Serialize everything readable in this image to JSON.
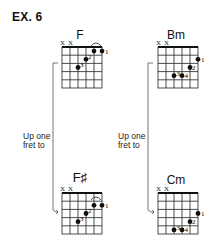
{
  "example_label": "EX. 6",
  "transitions": [
    {
      "line1": "Up one",
      "line2": "fret to"
    },
    {
      "line1": "Up one",
      "line2": "fret to"
    }
  ],
  "chords": [
    {
      "name": "F",
      "muted": [
        "X",
        "X"
      ],
      "barre": true,
      "dots": [
        {
          "string": 5,
          "fret": 1,
          "finger": "1"
        },
        {
          "string": 6,
          "fret": 1,
          "finger": ""
        },
        {
          "string": 4,
          "fret": 2,
          "finger": "2"
        },
        {
          "string": 3,
          "fret": 3,
          "finger": "3"
        }
      ]
    },
    {
      "name": "Bm",
      "muted": [
        "X",
        "X"
      ],
      "barre": false,
      "dots": [
        {
          "string": 6,
          "fret": 2,
          "finger": "1"
        },
        {
          "string": 5,
          "fret": 3,
          "finger": "2"
        },
        {
          "string": 3,
          "fret": 4,
          "finger": "3"
        },
        {
          "string": 4,
          "fret": 4,
          "finger": "4"
        }
      ]
    },
    {
      "name": "F♯",
      "muted": [
        "X",
        "X"
      ],
      "barre": true,
      "dots": [
        {
          "string": 5,
          "fret": 2,
          "finger": "1"
        },
        {
          "string": 6,
          "fret": 2,
          "finger": ""
        },
        {
          "string": 4,
          "fret": 3,
          "finger": "2"
        },
        {
          "string": 3,
          "fret": 4,
          "finger": "3"
        }
      ]
    },
    {
      "name": "Cm",
      "muted": [
        "X",
        "X"
      ],
      "barre": false,
      "dots": [
        {
          "string": 6,
          "fret": 3,
          "finger": "1"
        },
        {
          "string": 5,
          "fret": 4,
          "finger": "2"
        },
        {
          "string": 3,
          "fret": 5,
          "finger": "3"
        },
        {
          "string": 4,
          "fret": 5,
          "finger": "4"
        }
      ]
    }
  ]
}
